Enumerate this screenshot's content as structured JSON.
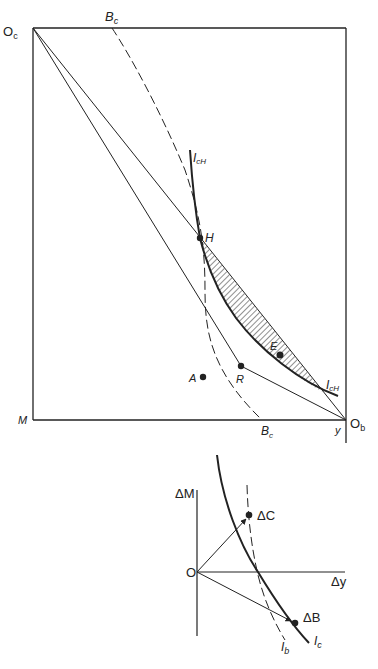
{
  "upper_diagram": {
    "labels": {
      "origin_c": "O",
      "origin_c_sub": "c",
      "origin_b": "O",
      "origin_b_sub": "b",
      "bc_top": "B",
      "bc_top_sub": "c",
      "bc_bottom": "B",
      "bc_bottom_sub": "c",
      "icH_top": "I",
      "icH_top_sub": "cH",
      "icH_bottom": "I",
      "icH_bottom_sub": "cH",
      "M": "M",
      "y": "y",
      "H": "H",
      "E": "E",
      "R": "R",
      "A": "A"
    }
  },
  "lower_diagram": {
    "labels": {
      "origin": "O",
      "delta_M": "ΔM",
      "delta_y": "Δy",
      "delta_C": "ΔC",
      "delta_B": "ΔB",
      "ib": "I",
      "ib_sub": "b",
      "ic": "I",
      "ic_sub": "c"
    }
  },
  "colors": {
    "ink": "#222222",
    "background": "#ffffff"
  }
}
